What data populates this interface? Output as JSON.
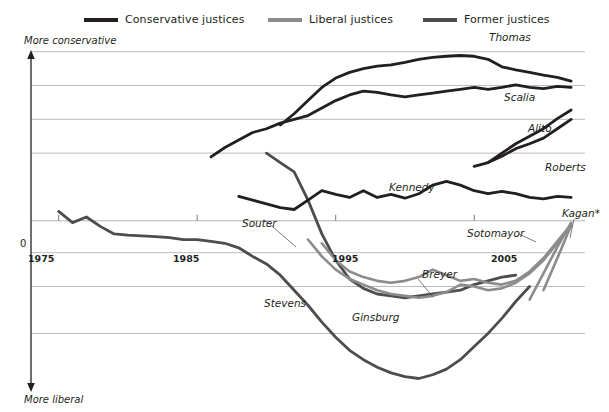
{
  "legend": {
    "items": [
      {
        "label": "Conservative justices",
        "color": "#231f20",
        "icon": "line-swatch-icon"
      },
      {
        "label": "Liberal justices",
        "color": "#8c8c8c",
        "icon": "line-swatch-icon"
      },
      {
        "label": "Former justices",
        "color": "#4d4d4d",
        "icon": "line-swatch-icon"
      }
    ]
  },
  "axes": {
    "y_top_caption": "More conservative",
    "y_bottom_caption": "More liberal",
    "zero_label": "0",
    "x_ticks": [
      "1975",
      "1985",
      "1995",
      "2005"
    ]
  },
  "series_labels": [
    {
      "name": "Thomas",
      "text": "Thomas"
    },
    {
      "name": "Scalia",
      "text": "Scalia"
    },
    {
      "name": "Alito",
      "text": "Alito"
    },
    {
      "name": "Roberts",
      "text": "Roberts"
    },
    {
      "name": "Kennedy",
      "text": "Kennedy"
    },
    {
      "name": "Souter",
      "text": "Souter"
    },
    {
      "name": "Kagan",
      "text": "Kagan*"
    },
    {
      "name": "Sotomayor",
      "text": "Sotomayor"
    },
    {
      "name": "Breyer",
      "text": "Breyer"
    },
    {
      "name": "Ginsburg",
      "text": "Ginsburg"
    },
    {
      "name": "Stevens",
      "text": "Stevens"
    }
  ],
  "chart_data": {
    "type": "line",
    "title": "",
    "xlabel": "",
    "ylabel": "Martin-Quinn ideology score",
    "xlim": [
      1973,
      2013
    ],
    "ylim": [
      -4.4,
      4.6
    ],
    "grid": true,
    "gridlines_y": [
      4.5,
      3.6,
      2.7,
      1.8,
      0.0,
      -0.85,
      -1.75,
      -3.0
    ],
    "legend_position": "top",
    "zero_axis": 0.0,
    "series": [
      {
        "name": "Stevens",
        "group": "Former justices",
        "color": "#4d4d4d",
        "x": [
          1975,
          1976,
          1977,
          1978,
          1979,
          1980,
          1981,
          1982,
          1983,
          1984,
          1985,
          1986,
          1987,
          1988,
          1989,
          1990,
          1991,
          1992,
          1993,
          1994,
          1995,
          1996,
          1997,
          1998,
          1999,
          2000,
          2001,
          2002,
          2003,
          2004,
          2005,
          2006,
          2007,
          2008,
          2009
        ],
        "y": [
          0.25,
          -0.05,
          0.1,
          -0.15,
          -0.35,
          -0.38,
          -0.4,
          -0.42,
          -0.45,
          -0.5,
          -0.5,
          -0.55,
          -0.6,
          -0.72,
          -0.95,
          -1.15,
          -1.45,
          -1.85,
          -2.25,
          -2.7,
          -3.1,
          -3.45,
          -3.7,
          -3.9,
          -4.05,
          -4.15,
          -4.2,
          -4.1,
          -3.95,
          -3.7,
          -3.35,
          -3.0,
          -2.6,
          -2.15,
          -1.75
        ]
      },
      {
        "name": "Souter",
        "group": "Former justices",
        "color": "#4d4d4d",
        "x": [
          1990,
          1991,
          1992,
          1993,
          1994,
          1995,
          1996,
          1997,
          1998,
          1999,
          2000,
          2001,
          2002,
          2003,
          2004,
          2005,
          2006,
          2007,
          2008
        ],
        "y": [
          1.8,
          1.55,
          1.3,
          0.55,
          -0.35,
          -1.05,
          -1.55,
          -1.8,
          -1.95,
          -2.0,
          -2.05,
          -2.0,
          -1.95,
          -1.9,
          -1.85,
          -1.7,
          -1.6,
          -1.5,
          -1.45
        ]
      },
      {
        "name": "Ginsburg",
        "group": "Liberal justices",
        "color": "#8c8c8c",
        "x": [
          1993,
          1994,
          1995,
          1996,
          1997,
          1998,
          1999,
          2000,
          2001,
          2002,
          2003,
          2004,
          2005,
          2006,
          2007,
          2008,
          2009,
          2010,
          2011,
          2012
        ],
        "y": [
          -0.5,
          -0.95,
          -1.3,
          -1.55,
          -1.7,
          -1.85,
          -1.95,
          -2.0,
          -2.05,
          -2.0,
          -1.9,
          -1.7,
          -1.75,
          -1.85,
          -1.8,
          -1.65,
          -1.4,
          -1.05,
          -0.6,
          -0.15
        ]
      },
      {
        "name": "Breyer",
        "group": "Liberal justices",
        "color": "#8c8c8c",
        "x": [
          1994,
          1995,
          1996,
          1997,
          1998,
          1999,
          2000,
          2001,
          2002,
          2003,
          2004,
          2005,
          2006,
          2007,
          2008,
          2009,
          2010,
          2011,
          2012
        ],
        "y": [
          -0.6,
          -1.05,
          -1.35,
          -1.5,
          -1.6,
          -1.65,
          -1.6,
          -1.5,
          -1.3,
          -1.45,
          -1.6,
          -1.55,
          -1.65,
          -1.7,
          -1.6,
          -1.35,
          -1.0,
          -0.55,
          -0.1
        ]
      },
      {
        "name": "Sotomayor",
        "group": "Liberal justices",
        "color": "#8c8c8c",
        "x": [
          2009,
          2010,
          2011,
          2012
        ],
        "y": [
          -2.1,
          -1.4,
          -0.7,
          -0.05
        ]
      },
      {
        "name": "Kagan",
        "group": "Liberal justices",
        "color": "#8c8c8c",
        "x": [
          2010,
          2011,
          2012
        ],
        "y": [
          -1.85,
          -1.0,
          -0.12
        ]
      },
      {
        "name": "Kennedy",
        "group": "Conservative justices",
        "color": "#231f20",
        "x": [
          1988,
          1989,
          1990,
          1991,
          1992,
          1993,
          1994,
          1995,
          1996,
          1997,
          1998,
          1999,
          2000,
          2001,
          2002,
          2003,
          2004,
          2005,
          2006,
          2007,
          2008,
          2009,
          2010,
          2011,
          2012
        ],
        "y": [
          0.65,
          0.55,
          0.45,
          0.35,
          0.3,
          0.55,
          0.8,
          0.7,
          0.62,
          0.8,
          0.62,
          0.7,
          0.6,
          0.72,
          0.95,
          1.05,
          0.95,
          0.8,
          0.72,
          0.78,
          0.72,
          0.62,
          0.58,
          0.65,
          0.62
        ]
      },
      {
        "name": "Scalia",
        "group": "Conservative justices",
        "color": "#231f20",
        "x": [
          1986,
          1987,
          1988,
          1989,
          1990,
          1991,
          1992,
          1993,
          1994,
          1995,
          1996,
          1997,
          1998,
          1999,
          2000,
          2001,
          2002,
          2003,
          2004,
          2005,
          2006,
          2007,
          2008,
          2009,
          2010,
          2011,
          2012
        ],
        "y": [
          1.7,
          1.95,
          2.15,
          2.35,
          2.45,
          2.6,
          2.7,
          2.8,
          3.0,
          3.2,
          3.35,
          3.45,
          3.42,
          3.35,
          3.3,
          3.35,
          3.4,
          3.45,
          3.5,
          3.55,
          3.5,
          3.55,
          3.62,
          3.55,
          3.52,
          3.58,
          3.55
        ]
      },
      {
        "name": "Thomas",
        "group": "Conservative justices",
        "color": "#231f20",
        "x": [
          1991,
          1992,
          1993,
          1994,
          1995,
          1996,
          1997,
          1998,
          1999,
          2000,
          2001,
          2002,
          2003,
          2004,
          2005,
          2006,
          2007,
          2008,
          2009,
          2010,
          2011,
          2012
        ],
        "y": [
          2.55,
          2.85,
          3.2,
          3.55,
          3.8,
          3.95,
          4.05,
          4.12,
          4.15,
          4.22,
          4.3,
          4.35,
          4.38,
          4.4,
          4.38,
          4.3,
          4.1,
          4.02,
          3.95,
          3.88,
          3.82,
          3.72
        ]
      },
      {
        "name": "Alito",
        "group": "Conservative justices",
        "color": "#231f20",
        "x": [
          2006,
          2007,
          2008,
          2009,
          2010,
          2011,
          2012
        ],
        "y": [
          1.55,
          1.8,
          2.05,
          2.25,
          2.45,
          2.72,
          2.95
        ]
      },
      {
        "name": "Roberts",
        "group": "Conservative justices",
        "color": "#231f20",
        "x": [
          2005,
          2006,
          2007,
          2008,
          2009,
          2010,
          2011,
          2012
        ],
        "y": [
          1.45,
          1.55,
          1.72,
          1.92,
          2.05,
          2.2,
          2.45,
          2.7
        ]
      }
    ]
  }
}
